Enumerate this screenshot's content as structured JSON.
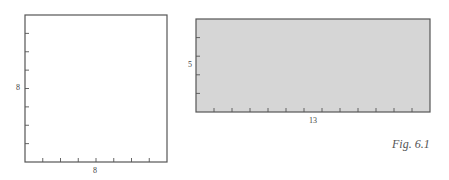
{
  "figure": {
    "caption": "Fig. 6.1",
    "square": {
      "width_label": "8",
      "height_label": "8",
      "cols": 8,
      "rows": 8,
      "fill": "#ffffff",
      "stroke": "#555555"
    },
    "rectangle": {
      "width_label": "13",
      "height_label": "5",
      "cols": 13,
      "rows": 5,
      "fill": "#d6d6d6",
      "stroke": "#555555"
    }
  }
}
